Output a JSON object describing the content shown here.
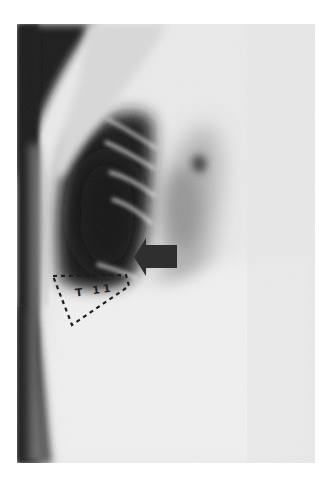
{
  "image": {
    "kind": "radiograph",
    "description": "Lateral chest/thoracic spine X-ray with annotation",
    "annotation_label": "T 11",
    "annotations": [
      {
        "type": "arrow",
        "direction": "left",
        "color": "#2e2e2e"
      },
      {
        "type": "dotted-triangle",
        "label": "T 11",
        "color": "#1e1e1e"
      }
    ]
  },
  "colors": {
    "background": "#ffffff",
    "film_light": "#ececec",
    "film_dark": "#1a1a1a",
    "arrow": "#2f2f2f"
  }
}
